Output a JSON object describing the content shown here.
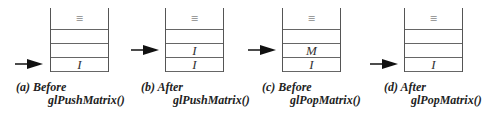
{
  "figure": {
    "panels": [
      {
        "id": "a",
        "caption_line1": "(a) Before",
        "caption_line2": "glPushMatrix()",
        "stack_top_symbol": "≡",
        "rows": [
          "",
          "",
          "I"
        ],
        "pointer_row": 2
      },
      {
        "id": "b",
        "caption_line1": "(b) After",
        "caption_line2": "glPushMatrix()",
        "stack_top_symbol": "≡",
        "rows": [
          "",
          "I",
          "I"
        ],
        "pointer_row": 1
      },
      {
        "id": "c",
        "caption_line1": "(c) Before",
        "caption_line2": "glPopMatrix()",
        "stack_top_symbol": "≡",
        "rows": [
          "",
          "M",
          "I"
        ],
        "pointer_row": 1
      },
      {
        "id": "d",
        "caption_line1": "(d) After",
        "caption_line2": "glPopMatrix()",
        "stack_top_symbol": "≡",
        "rows": [
          "",
          "",
          "I"
        ],
        "pointer_row": 2
      }
    ]
  }
}
